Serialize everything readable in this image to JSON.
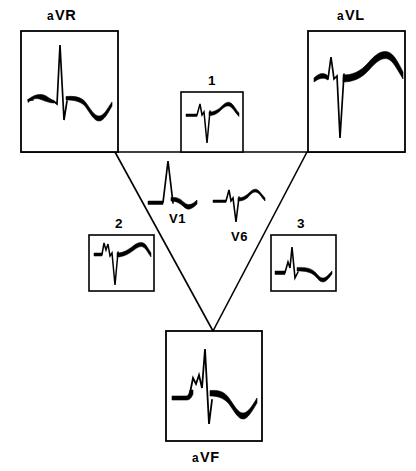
{
  "figure": {
    "background_color": "#ffffff",
    "stroke_color": "#000000",
    "width": 416,
    "height": 471
  },
  "triangle": {
    "name": "einthoven-triangle",
    "top_left": [
      21,
      152
    ],
    "top_right": [
      405,
      152
    ],
    "apex": [
      213,
      331
    ],
    "left_vertex_of_v": [
      115,
      152
    ],
    "right_vertex_of_v": [
      307,
      152
    ]
  },
  "leads": [
    {
      "id": "aVR",
      "label_prefix": "a",
      "label_main": "VR",
      "label_full": "aVR",
      "label_position": "above",
      "box": {
        "x": 21,
        "y": 31,
        "w": 97,
        "h": 121
      },
      "label_xy": [
        47,
        8
      ],
      "label_size": "big",
      "morphology": "tall R wave, deep S wave, inverted T wave"
    },
    {
      "id": "aVL",
      "label_prefix": "a",
      "label_main": "VL",
      "label_full": "aVL",
      "label_position": "above",
      "box": {
        "x": 308,
        "y": 31,
        "w": 97,
        "h": 121
      },
      "label_xy": [
        337,
        8
      ],
      "label_size": "big",
      "morphology": "small R wave, deep S wave, tall upright T wave"
    },
    {
      "id": "aVF",
      "label_prefix": "a",
      "label_main": "VF",
      "label_full": "aVF",
      "label_position": "below",
      "box": {
        "x": 166,
        "y": 331,
        "w": 96,
        "h": 110
      },
      "label_xy": [
        192,
        450
      ],
      "label_size": "big",
      "morphology": "notched tall R wave, inverted T wave"
    },
    {
      "id": "1",
      "label_prefix": "",
      "label_main": "1",
      "label_full": "1",
      "label_position": "above",
      "box": {
        "x": 181,
        "y": 92,
        "w": 62,
        "h": 60
      },
      "label_xy": [
        208,
        74
      ],
      "label_size": "num",
      "morphology": "small R wave, deep S wave, rounded upright T wave"
    },
    {
      "id": "2",
      "label_prefix": "",
      "label_main": "2",
      "label_full": "2",
      "label_position": "above",
      "box": {
        "x": 89,
        "y": 235,
        "w": 65,
        "h": 56
      },
      "label_xy": [
        115,
        217
      ],
      "label_size": "num",
      "morphology": "notched small R wave, deep S wave, elevated upright T wave"
    },
    {
      "id": "3",
      "label_prefix": "",
      "label_main": "3",
      "label_full": "3",
      "label_position": "above",
      "box": {
        "x": 271,
        "y": 235,
        "w": 65,
        "h": 56
      },
      "label_xy": [
        297,
        217
      ],
      "label_size": "num",
      "morphology": "tall notched R wave, inverted T wave"
    },
    {
      "id": "V1",
      "label_prefix": "",
      "label_main": "V1",
      "label_full": "V1",
      "label_position": "below",
      "box": null,
      "label_xy": [
        169,
        212
      ],
      "label_size": "mid",
      "morphology": "tall R wave, small inverted T wave"
    },
    {
      "id": "V6",
      "label_prefix": "",
      "label_main": "V6",
      "label_full": "V6",
      "label_position": "below",
      "box": null,
      "label_xy": [
        231,
        230
      ],
      "label_size": "mid",
      "morphology": "small R wave, deep S wave, small upright T wave"
    }
  ]
}
